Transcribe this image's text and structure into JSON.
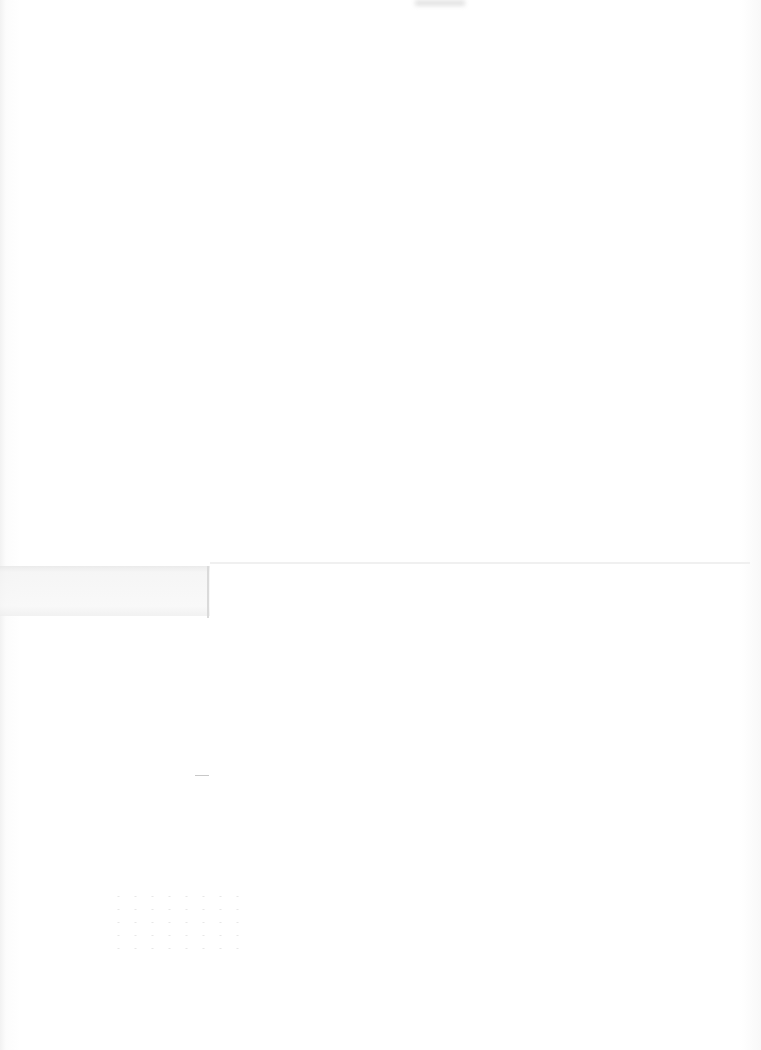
{
  "document": {
    "type": "blank scanned page",
    "text": ""
  }
}
